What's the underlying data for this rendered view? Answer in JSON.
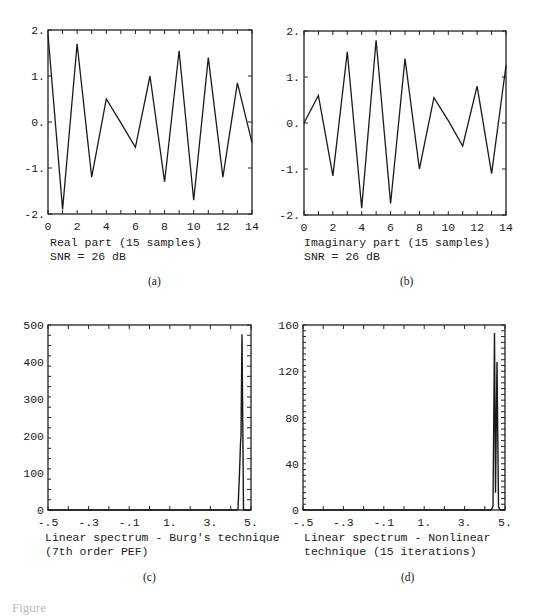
{
  "figure_caption": "Figure",
  "panels": {
    "a": {
      "label": "(a)",
      "caption_line1": "Real part (15 samples)",
      "caption_line2": "SNR = 26 dB",
      "ytick_labels": [
        "2.",
        "1.",
        "0.",
        "-1.",
        "-2."
      ],
      "xtick_labels": [
        "0",
        "2",
        "4",
        "6",
        "8",
        "10",
        "12",
        "14"
      ]
    },
    "b": {
      "label": "(b)",
      "caption_line1": "Imaginary part (15 samples)",
      "caption_line2": "SNR = 26 dB",
      "ytick_labels": [
        "2.",
        "1.",
        "0.",
        "-1.",
        "-2."
      ],
      "xtick_labels": [
        "0",
        "2",
        "4",
        "6",
        "8",
        "10",
        "12",
        "14"
      ]
    },
    "c": {
      "label": "(c)",
      "caption_line1": "Linear spectrum - Burg's technique",
      "caption_line2": "(7th order PEF)",
      "ytick_labels": [
        "500",
        "400",
        "300",
        "200",
        "100",
        "0"
      ],
      "xtick_labels": [
        "-.5",
        "-.3",
        "-.1",
        "1.",
        "3.",
        "5."
      ]
    },
    "d": {
      "label": "(d)",
      "caption_line1": "Linear spectrum - Nonlinear",
      "caption_line2": "technique (15 iterations)",
      "ytick_labels": [
        "160",
        "120",
        "80",
        "40",
        "0"
      ],
      "xtick_labels": [
        "-.5",
        "-.3",
        "-.1",
        "1.",
        "3.",
        "5."
      ]
    }
  },
  "chart_data": [
    {
      "type": "line",
      "panel": "a",
      "title": "Real part (15 samples), SNR = 26 dB",
      "xlabel": "",
      "ylabel": "",
      "x": [
        0,
        1,
        2,
        3,
        4,
        5,
        6,
        7,
        8,
        9,
        10,
        11,
        12,
        13,
        14
      ],
      "values": [
        1.9,
        -1.9,
        1.7,
        -1.2,
        0.5,
        -0.02,
        -0.55,
        1.0,
        -1.3,
        1.55,
        -1.7,
        1.4,
        -1.2,
        0.85,
        -0.45
      ],
      "xlim": [
        0,
        14
      ],
      "ylim": [
        -2,
        2
      ],
      "xticks": [
        0,
        2,
        4,
        6,
        8,
        10,
        12,
        14
      ],
      "yticks": [
        -2,
        -1,
        0,
        1,
        2
      ],
      "grid": false
    },
    {
      "type": "line",
      "panel": "b",
      "title": "Imaginary part (15 samples), SNR = 26 dB",
      "xlabel": "",
      "ylabel": "",
      "x": [
        0,
        1,
        2,
        3,
        4,
        5,
        6,
        7,
        8,
        9,
        10,
        11,
        12,
        13,
        14
      ],
      "values": [
        0.0,
        0.6,
        -1.15,
        1.55,
        -1.85,
        1.8,
        -1.75,
        1.4,
        -1.0,
        0.55,
        0.05,
        -0.5,
        0.8,
        -1.1,
        1.25
      ],
      "xlim": [
        0,
        14
      ],
      "ylim": [
        -2,
        2
      ],
      "xticks": [
        0,
        2,
        4,
        6,
        8,
        10,
        12,
        14
      ],
      "yticks": [
        -2,
        -1,
        0,
        1,
        2
      ],
      "grid": false
    },
    {
      "type": "line",
      "panel": "c",
      "title": "Linear spectrum - Burg's technique (7th order PEF)",
      "xlabel": "",
      "ylabel": "",
      "x": [
        -0.5,
        0.4,
        0.43,
        0.445,
        0.455,
        0.46,
        0.465,
        0.47,
        0.5
      ],
      "values": [
        0,
        0,
        2,
        100,
        180,
        200,
        475,
        0,
        0
      ],
      "xtick_labels": [
        "-.5",
        "-.3",
        "-.1",
        "1.",
        "3.",
        "5."
      ],
      "ylim": [
        0,
        500
      ],
      "yticks": [
        0,
        100,
        200,
        300,
        400,
        500
      ],
      "peak": {
        "value": 475,
        "shoulder": 180
      },
      "grid": false
    },
    {
      "type": "line",
      "panel": "d",
      "title": "Linear spectrum - Nonlinear technique (15 iterations)",
      "xlabel": "",
      "ylabel": "",
      "x": [
        -0.5,
        0.42,
        0.445,
        0.455,
        0.46,
        0.465,
        0.47,
        0.48,
        0.5
      ],
      "values": [
        0,
        0,
        3,
        153,
        15,
        128,
        3,
        0,
        0
      ],
      "xtick_labels": [
        "-.5",
        "-.3",
        "-.1",
        "1.",
        "3.",
        "5."
      ],
      "ylim": [
        0,
        160
      ],
      "yticks": [
        0,
        40,
        80,
        120,
        160
      ],
      "peaks": [
        153,
        128
      ],
      "grid": false
    }
  ]
}
